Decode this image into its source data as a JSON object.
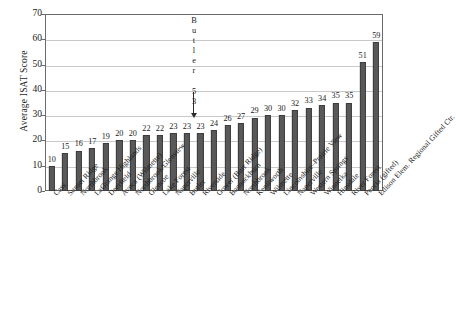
{
  "chart_data": {
    "type": "bar",
    "title": "",
    "xlabel": "",
    "ylabel": "Average ISAT Score",
    "ylim": [
      0,
      70
    ],
    "yticks": [
      0,
      10,
      20,
      30,
      40,
      50,
      60,
      70
    ],
    "grid": true,
    "legend": "none",
    "bar_color": "#595959",
    "categories": [
      "Cass",
      "Sunset Ridge",
      "Northbrook",
      "LaGrange Highlands",
      "Deerfield",
      "Avoca (Wilmette)",
      "Northbrook/Glenview",
      "Glencoe",
      "Lake Forest",
      "Naperville",
      "Butler",
      "Riverside",
      "Gower (Burr Ridge)",
      "Bannockburn",
      "Northbrook",
      "Kenilworth",
      "Wilmette",
      "Lincolnshire–Prairie View",
      "Naperville",
      "Western Springs",
      "Winnetka",
      "Hinsdale",
      "River Forest",
      "Peoria (gifted)",
      "Edison Elem. Regional Gifted Ctr."
    ],
    "values": [
      10,
      15,
      16,
      17,
      19,
      20,
      20,
      22,
      22,
      23,
      23,
      23,
      24,
      26,
      27,
      29,
      30,
      30,
      32,
      33,
      34,
      35,
      35,
      51,
      59
    ],
    "annotations": [
      {
        "name": "butler-callout",
        "text": "Butler 53",
        "vertical_chars": [
          "B",
          "u",
          "t",
          "l",
          "e",
          "r",
          "",
          "5",
          "3"
        ],
        "points_to_category": "Butler",
        "value": 53,
        "arrow": "down"
      }
    ]
  },
  "axis": {
    "y_title": "Average ISAT Score"
  }
}
